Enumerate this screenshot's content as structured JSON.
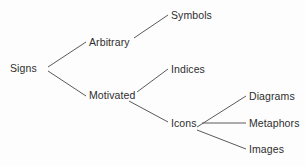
{
  "diagram": {
    "type": "tree",
    "title": "",
    "background_color": "#fdfdfd",
    "edge_color": "#5a5a5a",
    "text_color": "#2e2e2e",
    "nodes": [
      {
        "id": "signs",
        "label": "Signs",
        "x": 10,
        "y": 62,
        "level": 0
      },
      {
        "id": "arbitrary",
        "label": "Arbitrary",
        "x": 89,
        "y": 36,
        "level": 1
      },
      {
        "id": "motivated",
        "label": "Motivated",
        "x": 89,
        "y": 89,
        "level": 1
      },
      {
        "id": "symbols",
        "label": "Symbols",
        "x": 171,
        "y": 9,
        "level": 2
      },
      {
        "id": "indices",
        "label": "Indices",
        "x": 171,
        "y": 63,
        "level": 2
      },
      {
        "id": "icons",
        "label": "Icons",
        "x": 171,
        "y": 117,
        "level": 2
      },
      {
        "id": "diagrams",
        "label": "Diagrams",
        "x": 249,
        "y": 90,
        "level": 3
      },
      {
        "id": "metaphors",
        "label": "Metaphors",
        "x": 249,
        "y": 117,
        "level": 3
      },
      {
        "id": "images",
        "label": "Images",
        "x": 249,
        "y": 143,
        "level": 3
      }
    ],
    "edges": [
      {
        "id": "signs-arbitrary",
        "from": "Signs",
        "to": "Arbitrary",
        "x1": 48,
        "y1": 67,
        "x2": 86,
        "y2": 42
      },
      {
        "id": "signs-motivated",
        "from": "Signs",
        "to": "Motivated",
        "x1": 48,
        "y1": 71,
        "x2": 86,
        "y2": 96
      },
      {
        "id": "arbitrary-symbols",
        "from": "Arbitrary",
        "to": "Symbols",
        "x1": 134,
        "y1": 38,
        "x2": 168,
        "y2": 15
      },
      {
        "id": "motivated-indices",
        "from": "Motivated",
        "to": "Indices",
        "x1": 137,
        "y1": 92,
        "x2": 168,
        "y2": 69
      },
      {
        "id": "motivated-icons",
        "from": "Motivated",
        "to": "Icons",
        "x1": 129,
        "y1": 101,
        "x2": 168,
        "y2": 122
      },
      {
        "id": "icons-diagrams",
        "from": "Icons",
        "to": "Diagrams",
        "x1": 197,
        "y1": 127,
        "x2": 246,
        "y2": 96
      },
      {
        "id": "icons-metaphors",
        "from": "Icons",
        "to": "Metaphors",
        "x1": 202,
        "y1": 123,
        "x2": 246,
        "y2": 123
      },
      {
        "id": "icons-images",
        "from": "Icons",
        "to": "Images",
        "x1": 197,
        "y1": 130,
        "x2": 246,
        "y2": 149
      }
    ]
  }
}
